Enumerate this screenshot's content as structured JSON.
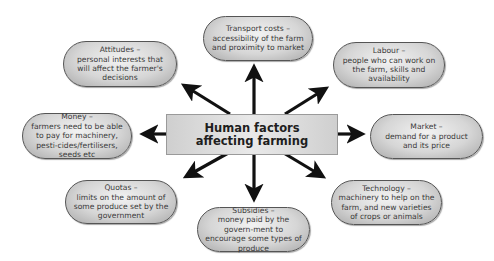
{
  "diagram": {
    "type": "spider-diagram",
    "center": {
      "label": "Human factors affecting farming"
    },
    "nodes": [
      {
        "id": "transport",
        "title": "Transport costs –",
        "desc": "accessibility of the farm and proximity to market"
      },
      {
        "id": "attitudes",
        "title": "Attitudes –",
        "desc": "personal interests that will affect the farmer's decisions"
      },
      {
        "id": "labour",
        "title": "Labour –",
        "desc": "people who can work on the farm, skills and availability"
      },
      {
        "id": "money",
        "title": "Money –",
        "desc": "farmers need to be able to pay for machinery, pesti-cides/fertilisers, seeds etc"
      },
      {
        "id": "market",
        "title": "Market –",
        "desc": "demand for a product and its price"
      },
      {
        "id": "quotas",
        "title": "Quotas –",
        "desc": "limits on the amount of some produce set by the government"
      },
      {
        "id": "subsidies",
        "title": "Subsidies –",
        "desc": "money paid by the govern-ment to encourage some types of produce"
      },
      {
        "id": "technology",
        "title": "Technology –",
        "desc": "machinery to help on the farm, and new varieties of crops or animals"
      }
    ],
    "edges": [
      {
        "from": "center",
        "to": "transport"
      },
      {
        "from": "center",
        "to": "attitudes"
      },
      {
        "from": "center",
        "to": "labour"
      },
      {
        "from": "center",
        "to": "money"
      },
      {
        "from": "center",
        "to": "market"
      },
      {
        "from": "center",
        "to": "quotas"
      },
      {
        "from": "center",
        "to": "subsidies"
      },
      {
        "from": "center",
        "to": "technology"
      }
    ],
    "colors": {
      "arrow": "#111111",
      "bubble_fill": "#d6d6d6",
      "bubble_border": "#555555",
      "center_fill": "#dcdcdc"
    }
  }
}
